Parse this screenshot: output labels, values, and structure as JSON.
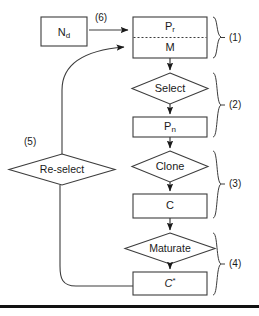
{
  "figure": {
    "nodes": {
      "nd": {
        "label": "N",
        "sub": "d",
        "shape": "box"
      },
      "pr": {
        "label": "P",
        "sub": "r",
        "shape": "box-top"
      },
      "m": {
        "label": "M",
        "shape": "box-bottom"
      },
      "select": {
        "label": "Select",
        "shape": "diamond"
      },
      "pn": {
        "label": "P",
        "sub": "n",
        "shape": "box"
      },
      "clone": {
        "label": "Clone",
        "shape": "diamond"
      },
      "c": {
        "label": "C",
        "shape": "box"
      },
      "maturate": {
        "label": "Maturate",
        "shape": "diamond"
      },
      "cstar": {
        "label": "C",
        "sup": "*",
        "shape": "box"
      },
      "reselect": {
        "label": "Re-select",
        "shape": "diamond"
      }
    },
    "edge_labels": {
      "nd_to_pr": "(6)",
      "reselect": "(5)"
    },
    "group_labels": [
      {
        "id": "group-1",
        "label": "(1)"
      },
      {
        "id": "group-2",
        "label": "(2)"
      },
      {
        "id": "group-3",
        "label": "(3)"
      },
      {
        "id": "group-4",
        "label": "(4)"
      }
    ],
    "colors": {
      "stroke": "#3c3c3c",
      "text": "#1a1a1a",
      "background": "#ffffff",
      "rule": "#111111"
    }
  }
}
